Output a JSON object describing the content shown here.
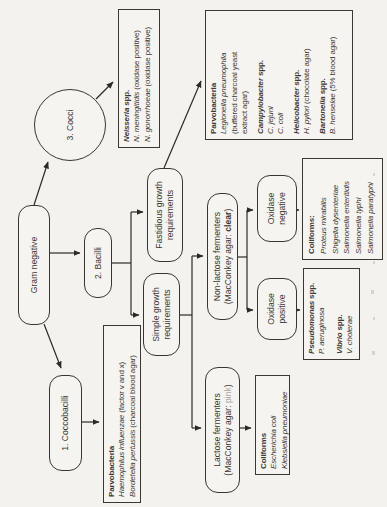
{
  "nodes": {
    "gram_negative": {
      "label": "Gram negative"
    },
    "coccobacilli": {
      "label": "1. Coccobacilli"
    },
    "bacilli": {
      "label": "2. Bacilli"
    },
    "cocci": {
      "label": "3. Cocci"
    },
    "simple_growth": {
      "line1": "Simple growth",
      "line2": "requirements"
    },
    "fastidious_growth": {
      "line1": "Fastidious growth",
      "line2": "requirements"
    },
    "lactose_fermenters": {
      "line1": "Lactose fermenters",
      "line2_prefix": "(MacConkey agar: ",
      "line2_result": "pink",
      "line2_suffix": ")"
    },
    "non_lactose_fermenters": {
      "line1": "Non-lactose fermenters",
      "line2_prefix": "(MacConkey agar: ",
      "line2_result": "clear",
      "line2_suffix": ")"
    },
    "oxidase_negative": {
      "line1": "Oxidase",
      "line2": "negative"
    },
    "oxidase_positive": {
      "line1": "Oxidase",
      "line2": "positive"
    }
  },
  "results": {
    "neisseria": {
      "title_i": "Neisseria",
      "title_r": " spp.",
      "line1_i": "N. meningitidis",
      "line1_r": " (oxidase positive)",
      "line2_i": "N. gonorrhoeae",
      "line2_r": " (oxidase positive)"
    },
    "parvobacteria_coccobacilli": {
      "title": "Parvobacteria",
      "line1_i": "Haemophilus influenzae",
      "line1_r": " (factor v and x)",
      "line2_i": "Bordetella pertussis",
      "line2_r": " (charcoal blood agar)"
    },
    "parvobacteria_fastidious": {
      "title": "Parvobacteria",
      "legionella_i": "Legionella pneumophila",
      "legionella_r2": "(buffered charcoal yeast",
      "legionella_r3": "extract agar)",
      "campylobacter_title_i": "Campylobacter",
      "campylobacter_title_r": " spp.",
      "campylobacter_sp1": "C. jejuni",
      "campylobacter_sp2": "C. coli",
      "helicobacter_title_i": "Helicobacter",
      "helicobacter_title_r": " spp.",
      "helicobacter_sp_i": "H. pylori",
      "helicobacter_sp_r": " (chocolate agar)",
      "bartonella_title_i": "Bartonella",
      "bartonella_title_r": " spp.",
      "bartonella_sp_i": "B. henselae",
      "bartonella_sp_r": " (5% blood agar)"
    },
    "coliforms_non_lactose": {
      "title": "Coliforms:",
      "sp1": "Proteus mirabilis",
      "sp2": "Shigella dysenteriae",
      "sp3": "Salmonella enteritidis",
      "sp4": "Salmonella typhi",
      "sp5": "Salmonella paratyphi"
    },
    "pseudomonas_vibrio": {
      "pseudomonas_title_i": "Pseudomonas",
      "pseudomonas_title_r": " spp.",
      "pseudomonas_sp": "P. aeruginosa",
      "vibrio_title_i": "Vibrio",
      "vibrio_title_r": " spp.",
      "vibrio_sp": "V. cholerae"
    },
    "coliforms_lactose": {
      "title": "Coliforms",
      "sp1": "Escherichia coli",
      "sp2": "Klebsiella pneumoniae"
    }
  },
  "colors": {
    "ink": "#2b2a27",
    "paper": "#f4f2ee",
    "result_pink": "#a9a5a0"
  }
}
